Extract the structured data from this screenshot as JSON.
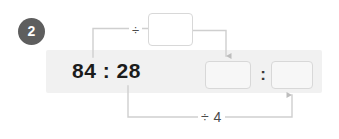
{
  "exercise": {
    "number": "2",
    "expression": "84 : 28",
    "result_separator": ":",
    "operations": {
      "top_label": "÷",
      "bottom_label": "÷ 4"
    },
    "inputs": {
      "divisor_value": "",
      "divisor_placeholder": "",
      "result_left_value": "",
      "result_left_placeholder": "",
      "result_right_value": "",
      "result_right_placeholder": ""
    },
    "colors": {
      "badge_background": "#5e5e5e",
      "badge_text": "#ffffff",
      "band_background": "#f1f1f1",
      "box_border": "#d8d8d8",
      "box_fill": "#f7f7f7",
      "wire": "#cfcfcf",
      "text": "#1c1c1c"
    }
  }
}
